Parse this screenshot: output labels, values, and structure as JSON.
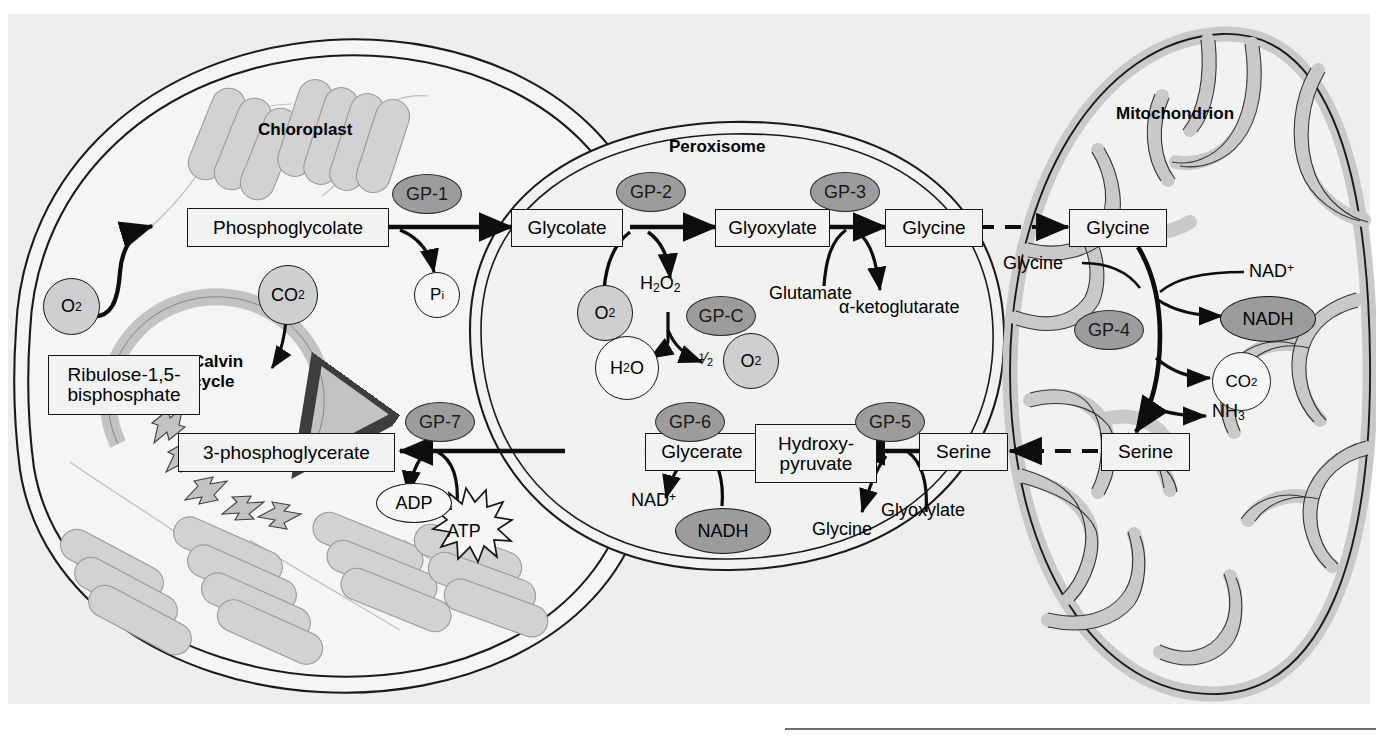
{
  "figure": {
    "background_color": "#eeeeee",
    "page_color": "#ffffff"
  },
  "organelles": [
    {
      "name": "chloroplast",
      "label": "Chloroplast"
    },
    {
      "name": "peroxisome",
      "label": "Peroxisome"
    },
    {
      "name": "mitochondrion",
      "label": "Mitochondrion"
    }
  ],
  "cycle": {
    "label_line1": "Calvin",
    "label_line2": "cycle"
  },
  "metabolite_boxes": [
    {
      "name": "phosphoglycolate",
      "label": "Phosphoglycolate"
    },
    {
      "name": "ribulose-bisphosphate",
      "line1": "Ribulose-1,5-",
      "line2": "bisphosphate"
    },
    {
      "name": "3-phosphoglycerate",
      "label": "3-phosphoglycerate"
    },
    {
      "name": "glycolate",
      "label": "Glycolate"
    },
    {
      "name": "glyoxylate",
      "label": "Glyoxylate"
    },
    {
      "name": "glycine-peroxisome",
      "label": "Glycine"
    },
    {
      "name": "glycine-mitochondrion",
      "label": "Glycine"
    },
    {
      "name": "glycerate",
      "label": "Glycerate"
    },
    {
      "name": "hydroxypyruvate",
      "line1": "Hydroxy-",
      "line2": "pyruvate"
    },
    {
      "name": "serine-peroxisome",
      "label": "Serine"
    },
    {
      "name": "serine-mitochondrion",
      "label": "Serine"
    }
  ],
  "enzymes": [
    {
      "name": "gp-1",
      "label": "GP-1"
    },
    {
      "name": "gp-2",
      "label": "GP-2"
    },
    {
      "name": "gp-3",
      "label": "GP-3"
    },
    {
      "name": "gp-c",
      "label": "GP-C"
    },
    {
      "name": "gp-4",
      "label": "GP-4"
    },
    {
      "name": "gp-5",
      "label": "GP-5"
    },
    {
      "name": "gp-6",
      "label": "GP-6"
    },
    {
      "name": "gp-7",
      "label": "GP-7"
    }
  ],
  "small_molecules": {
    "o2_chloroplast": "O2",
    "co2_chloroplast": "CO2",
    "pi": "Pi",
    "o2_peroxisome": "O2",
    "h2o2": "H2O2",
    "h2o": "H2O",
    "half_o2_prefix": "1/2",
    "half_o2": "O2",
    "glutamate": "Glutamate",
    "alpha_ketoglutarate": "α-ketoglutarate",
    "glycine_mito_side": "Glycine",
    "nad_plus_mito": "NAD+",
    "nadh_mito": "NADH",
    "co2_mito": "CO2",
    "nh3": "NH3",
    "nad_plus_perox": "NAD+",
    "nadh_perox": "NADH",
    "glyoxylate_perox_lower": "Glyoxylate",
    "glycine_perox_lower": "Glycine",
    "adp": "ADP",
    "atp": "ATP"
  },
  "colors": {
    "enzyme_fill": "#9c9c9c",
    "shaded_molecule_fill": "#cfcfcf",
    "open_molecule_fill": "#f7f7f7",
    "membrane_fill": "#cccccc",
    "stroke": "#161616",
    "panel": "#eeeeee"
  }
}
